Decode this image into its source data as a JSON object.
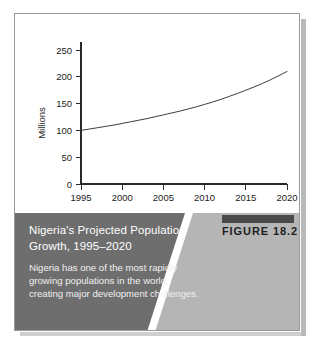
{
  "figure": {
    "number_label": "FIGURE 18.2",
    "caption_title": "Nigeria's Projected Population Growth, 1995–2020",
    "caption_body": "Nigeria has one of the most rapidly growing populations in the world, creating major development challenges.",
    "caption_bg_color": "#6e6e6e",
    "caption_wedge_color": "#b5b5b5",
    "frame_border_color": "#9a9a9a",
    "shadow_color": "#b9b9b9",
    "rule_color": "#4a4a4a"
  },
  "chart_data": {
    "type": "line",
    "title": "",
    "xlabel": "",
    "ylabel": "Millions",
    "xlim": [
      1995,
      2020
    ],
    "ylim": [
      0,
      250
    ],
    "xticks": [
      1995,
      2000,
      2005,
      2010,
      2015,
      2020
    ],
    "xtick_labels": [
      "1995",
      "2000",
      "2005",
      "2010",
      "2015",
      "2020"
    ],
    "yticks": [
      0,
      50,
      100,
      150,
      200,
      250
    ],
    "ytick_labels": [
      "0",
      "50",
      "100",
      "150",
      "200",
      "250"
    ],
    "grid": false,
    "legend": false,
    "line_color": "#3d3d3d",
    "series": [
      {
        "name": "Projected population",
        "x": [
          1995,
          1996,
          1997,
          1998,
          1999,
          2000,
          2001,
          2002,
          2003,
          2004,
          2005,
          2006,
          2007,
          2008,
          2009,
          2010,
          2011,
          2012,
          2013,
          2014,
          2015,
          2016,
          2017,
          2018,
          2019,
          2020
        ],
        "values": [
          100,
          102.5,
          105,
          107.5,
          110,
          113,
          116,
          119,
          122,
          125.5,
          129,
          132.5,
          136,
          140,
          144,
          148.5,
          153,
          158,
          163.5,
          169,
          175,
          181,
          187.5,
          194.5,
          202,
          210
        ]
      }
    ]
  }
}
